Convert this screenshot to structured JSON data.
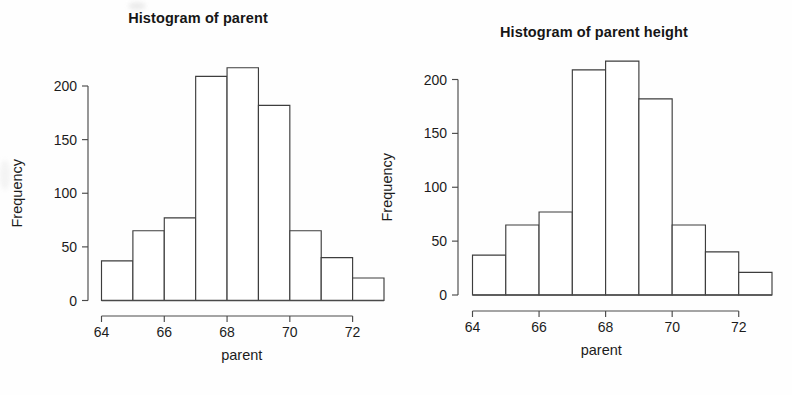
{
  "page": {
    "background_color": "#ffffff",
    "ink_color": "#3d3d3d"
  },
  "charts": [
    {
      "title": "Histogram of parent",
      "xlabel": "parent",
      "ylabel": "Frequency",
      "x_ticks": [
        "64",
        "66",
        "68",
        "70",
        "72"
      ],
      "y_ticks": [
        "0",
        "50",
        "100",
        "150",
        "200"
      ]
    },
    {
      "title": "Histogram of parent height",
      "xlabel": "parent",
      "ylabel": "Frequency",
      "x_ticks": [
        "64",
        "66",
        "68",
        "70",
        "72"
      ],
      "y_ticks": [
        "0",
        "50",
        "100",
        "150",
        "200"
      ]
    }
  ],
  "chart_data": [
    {
      "type": "bar",
      "title": "Histogram of parent",
      "subtitle": "",
      "xlabel": "parent",
      "ylabel": "Frequency",
      "categories": [
        "64-65",
        "65-66",
        "66-67",
        "67-68",
        "68-69",
        "69-70",
        "70-71",
        "71-72",
        "72-73"
      ],
      "bin_edges": [
        64,
        65,
        66,
        67,
        68,
        69,
        70,
        71,
        72,
        73
      ],
      "values": [
        37,
        65,
        77,
        209,
        217,
        182,
        65,
        40,
        21
      ],
      "xlim": [
        64,
        73
      ],
      "ylim": [
        0,
        217
      ],
      "xticks": [
        64,
        66,
        68,
        70,
        72
      ],
      "yticks": [
        0,
        50,
        100,
        150,
        200
      ],
      "grid": false,
      "legend": false,
      "bar_fill": "#ffffff",
      "bar_stroke": "#3d3d3d"
    },
    {
      "type": "bar",
      "title": "Histogram of parent height",
      "subtitle": "",
      "xlabel": "parent",
      "ylabel": "Frequency",
      "categories": [
        "64-65",
        "65-66",
        "66-67",
        "67-68",
        "68-69",
        "69-70",
        "70-71",
        "71-72",
        "72-73"
      ],
      "bin_edges": [
        64,
        65,
        66,
        67,
        68,
        69,
        70,
        71,
        72,
        73
      ],
      "values": [
        37,
        65,
        77,
        209,
        217,
        182,
        65,
        40,
        21
      ],
      "xlim": [
        64,
        73
      ],
      "ylim": [
        0,
        217
      ],
      "xticks": [
        64,
        66,
        68,
        70,
        72
      ],
      "yticks": [
        0,
        50,
        100,
        150,
        200
      ],
      "grid": false,
      "legend": false,
      "bar_fill": "#ffffff",
      "bar_stroke": "#3d3d3d"
    }
  ]
}
